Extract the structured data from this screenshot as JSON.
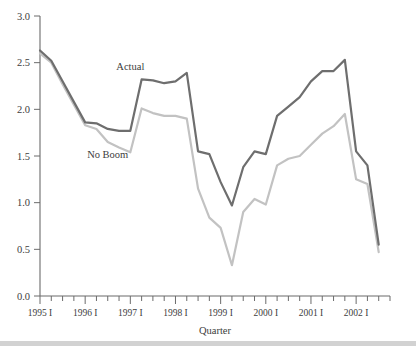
{
  "chart_data": {
    "type": "line",
    "title": "",
    "xlabel": "Quarter",
    "ylabel": "",
    "ylim": [
      0.0,
      3.0
    ],
    "ytick_values": [
      0.0,
      0.5,
      1.0,
      1.5,
      2.0,
      2.5,
      3.0
    ],
    "ytick_labels": [
      "0.0",
      "0.5",
      "1.0",
      "1.5",
      "2.0",
      "2.5",
      "3.0"
    ],
    "grid": false,
    "legend_position": "inline-annotation",
    "x_major_labels": [
      "1995 I",
      "1996 I",
      "1997 I",
      "1998 I",
      "1999 I",
      "2000 I",
      "2001 I",
      "2002 I"
    ],
    "x_minor_ticks_per_major": 4,
    "x": [
      "1995 I",
      "1995 II",
      "1995 III",
      "1995 IV",
      "1996 I",
      "1996 II",
      "1996 III",
      "1996 IV",
      "1997 I",
      "1997 II",
      "1997 III",
      "1997 IV",
      "1998 I",
      "1998 II",
      "1998 III",
      "1998 IV",
      "1999 I",
      "1999 II",
      "1999 III",
      "1999 IV",
      "2000 I",
      "2000 II",
      "2000 III",
      "2000 IV",
      "2001 I",
      "2001 II",
      "2001 III",
      "2001 IV",
      "2002 I",
      "2002 II",
      "2002 III"
    ],
    "series": [
      {
        "name": "Actual",
        "color": "#6e6e6e",
        "label_x": "1997 I",
        "label_y": 2.42,
        "values": [
          2.63,
          2.52,
          2.3,
          2.08,
          1.86,
          1.85,
          1.79,
          1.77,
          1.77,
          2.32,
          2.31,
          2.28,
          2.3,
          2.39,
          1.55,
          1.52,
          1.22,
          0.97,
          1.38,
          1.55,
          1.52,
          1.93,
          2.03,
          2.13,
          2.3,
          2.41,
          2.41,
          2.53,
          1.55,
          1.4,
          0.55
        ]
      },
      {
        "name": "No Boom",
        "color": "#c2c2c2",
        "label_x": "1996 III",
        "label_y": 1.48,
        "values": [
          2.6,
          2.5,
          2.27,
          2.05,
          1.83,
          1.79,
          1.65,
          1.59,
          1.54,
          2.01,
          1.96,
          1.93,
          1.93,
          1.9,
          1.15,
          0.84,
          0.73,
          0.33,
          0.9,
          1.04,
          0.98,
          1.4,
          1.47,
          1.5,
          1.62,
          1.74,
          1.82,
          1.95,
          1.25,
          1.2,
          0.47
        ]
      }
    ]
  },
  "labels": {
    "actual": "Actual",
    "no_boom": "No Boom",
    "quarter": "Quarter"
  }
}
